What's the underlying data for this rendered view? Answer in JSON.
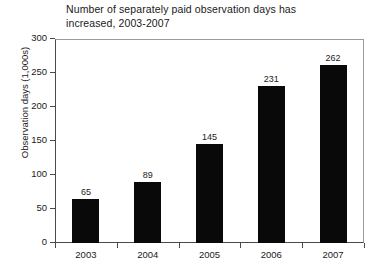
{
  "chart_data": {
    "type": "bar",
    "title": "Number of separately paid observation days has increased, 2003-2007",
    "title_line1": "Number of separately paid observation days has",
    "title_line2": "increased, 2003-2007",
    "xlabel": "",
    "ylabel": "Observation days (1,000s)",
    "categories": [
      "2003",
      "2004",
      "2005",
      "2006",
      "2007"
    ],
    "values": [
      65,
      89,
      145,
      231,
      262
    ],
    "value_labels": [
      "65",
      "89",
      "145",
      "231",
      "262"
    ],
    "ylim": [
      0,
      300
    ],
    "yticks": [
      0,
      50,
      100,
      150,
      200,
      250,
      300
    ],
    "ytick_labels": [
      "0",
      "50",
      "100",
      "150",
      "200",
      "250",
      "300"
    ],
    "grid": false,
    "legend": false,
    "bar_color": "#090909",
    "axis_color": "#4a4a4a",
    "background": "#ffffff"
  }
}
